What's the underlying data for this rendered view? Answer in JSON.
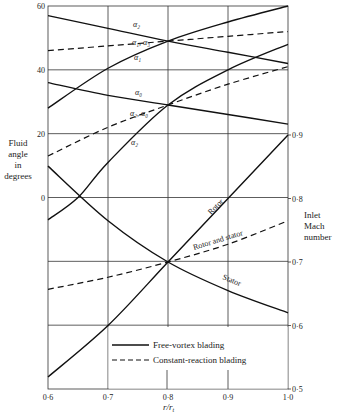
{
  "chart_data": {
    "type": "line",
    "title": "",
    "xlabel": "r/r_t",
    "ylabel_left": "Fluid angle in degrees",
    "ylabel_right": "Inlet Mach number",
    "x_ticks": [
      "0·6",
      "0·7",
      "0·8",
      "0·9",
      "1·0"
    ],
    "x_values": [
      0.6,
      0.7,
      0.8,
      0.9,
      1.0
    ],
    "xlim": [
      0.6,
      1.0
    ],
    "ylim_left": [
      -60,
      60
    ],
    "y_ticks_left": [
      "60",
      "40",
      "20",
      "0"
    ],
    "ylim_right": [
      0.5,
      0.9
    ],
    "y_ticks_right": [
      "0·9",
      "0·8",
      "0·7",
      "0·6",
      "0·5"
    ],
    "grid": true,
    "legend": [
      {
        "label": "Free-vortex blading",
        "style": "solid"
      },
      {
        "label": "Constant-reaction blading",
        "style": "dashed"
      }
    ],
    "angle_series": [
      {
        "name": "α2 (upper)",
        "label": "α₂",
        "style": "solid",
        "x": [
          0.6,
          0.7,
          0.8,
          0.9,
          1.0
        ],
        "values": [
          57,
          53,
          49,
          45.5,
          42
        ]
      },
      {
        "name": "α1, α3",
        "label": "α₁, α₃",
        "style": "dashed",
        "x": [
          0.6,
          0.7,
          0.8,
          0.9,
          1.0
        ],
        "values": [
          46,
          47.5,
          49,
          50.5,
          52
        ]
      },
      {
        "name": "α1",
        "label": "α₁",
        "style": "solid",
        "x": [
          0.6,
          0.7,
          0.8,
          0.9,
          1.0
        ],
        "values": [
          28,
          40.5,
          49,
          55,
          60
        ]
      },
      {
        "name": "α0",
        "label": "α₀",
        "style": "solid",
        "x": [
          0.6,
          0.7,
          0.8,
          0.9,
          1.0
        ],
        "values": [
          36,
          32,
          29,
          26,
          23
        ]
      },
      {
        "name": "α2, α0",
        "label": "α₂, α₀",
        "style": "dashed",
        "x": [
          0.6,
          0.7,
          0.8,
          0.9,
          1.0
        ],
        "values": [
          13,
          22,
          29,
          35.5,
          41
        ]
      },
      {
        "name": "α2 (lower)",
        "label": "α₂",
        "style": "solid",
        "x": [
          0.6,
          0.65,
          0.7,
          0.8,
          0.9,
          1.0
        ],
        "values": [
          -7,
          0,
          11,
          29,
          40,
          48
        ]
      }
    ],
    "mach_series": [
      {
        "name": "Rotor",
        "label": "Rotor",
        "style": "solid",
        "x": [
          0.6,
          0.7,
          0.8,
          0.9,
          1.0
        ],
        "values": [
          0.519,
          0.6,
          0.7,
          0.8,
          0.9
        ]
      },
      {
        "name": "Rotor and stator",
        "label": "Rotor and stator",
        "style": "dashed",
        "x": [
          0.6,
          0.7,
          0.8,
          0.9,
          1.0
        ],
        "values": [
          0.657,
          0.676,
          0.7,
          0.728,
          0.765
        ]
      },
      {
        "name": "Stator",
        "label": "Stator",
        "style": "solid",
        "x": [
          0.6,
          0.7,
          0.8,
          0.9,
          1.0
        ],
        "values": [
          0.851,
          0.765,
          0.7,
          0.655,
          0.62
        ]
      }
    ]
  },
  "labels": {
    "left_axis": [
      "Fluid",
      "angle",
      "in",
      "degrees"
    ],
    "right_axis": [
      "Inlet",
      "Mach",
      "number"
    ],
    "x_axis": "r/r",
    "x_axis_sub": "t",
    "legend_solid": "Free-vortex blading",
    "legend_dashed": "Constant-reaction blading",
    "rotor": "Rotor",
    "rotor_and_stator": "Rotor and stator",
    "stator": "Stator",
    "a2_top": "α₂",
    "a1a3": "α₁, α₃",
    "a1": "α₁",
    "a0": "α₀",
    "a2a0": "α₂, α₀",
    "a2_low": "α₂"
  }
}
